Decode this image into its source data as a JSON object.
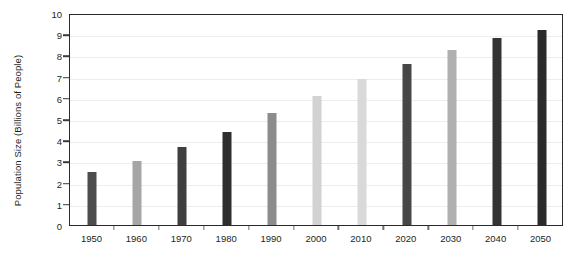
{
  "chart_data": {
    "type": "bar",
    "title": "",
    "subtitle": "",
    "xlabel": "",
    "ylabel": "Population Size (Billions of People)",
    "categories": [
      "1950",
      "1960",
      "1970",
      "1980",
      "1990",
      "2000",
      "2010",
      "2020",
      "2030",
      "2040",
      "2050"
    ],
    "values": [
      2.5,
      3.0,
      3.7,
      4.4,
      5.3,
      6.1,
      6.9,
      7.6,
      8.25,
      8.8,
      9.2
    ],
    "bar_colors": [
      "#4d4d4d",
      "#a6a6a6",
      "#3f3f3f",
      "#2e2e2e",
      "#8c8c8c",
      "#d2d2d2",
      "#d9d9d9",
      "#474747",
      "#b0b0b0",
      "#333333",
      "#2b2b2b"
    ],
    "ylim": [
      0,
      10
    ],
    "y_ticks": [
      0,
      1,
      2,
      3,
      4,
      5,
      6,
      7,
      8,
      9,
      10
    ],
    "y_tick_labels": [
      "0",
      "1",
      "2",
      "3",
      "4",
      "5",
      "6",
      "7",
      "8",
      "9",
      "10"
    ],
    "grid": true,
    "grid_axis": "y",
    "legend": false,
    "legend_position": "none",
    "frame_color": "#2b2b2b",
    "gridline_color": "#ededed",
    "background_color": "#ffffff",
    "text_color": "#231f20"
  }
}
